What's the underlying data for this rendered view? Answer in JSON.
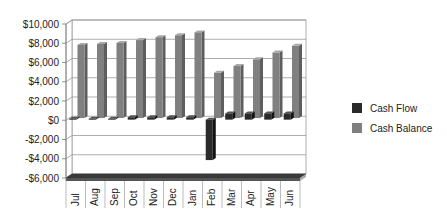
{
  "chart_data": {
    "type": "bar",
    "style": "3d-clustered-column",
    "title": "",
    "xlabel": "",
    "ylabel": "",
    "categories": [
      "Jul",
      "Aug",
      "Sep",
      "Oct",
      "Nov",
      "Dec",
      "Jan",
      "Feb",
      "Mar",
      "Apr",
      "May",
      "Jun"
    ],
    "series": [
      {
        "name": "Cash Flow",
        "color": "#2a2a2a",
        "values": [
          100,
          100,
          100,
          250,
          250,
          250,
          250,
          -4200,
          650,
          650,
          650,
          650
        ]
      },
      {
        "name": "Cash Balance",
        "color": "#808080",
        "values": [
          7600,
          7700,
          7800,
          8100,
          8400,
          8600,
          8900,
          4700,
          5400,
          6100,
          6800,
          7500
        ]
      }
    ],
    "ylim": [
      -6000,
      10000
    ],
    "yticks": [
      10000,
      8000,
      6000,
      4000,
      2000,
      0,
      -2000,
      -4000,
      -6000
    ],
    "ytick_labels": [
      "$10,000",
      "$8,000",
      "$6,000",
      "$4,000",
      "$2,000",
      "$0",
      "-$2,000",
      "-$4,000",
      "-$6,000"
    ],
    "grid": true,
    "legend_position": "right"
  },
  "legend": {
    "items": [
      {
        "label": "Cash Flow",
        "color": "#2a2a2a"
      },
      {
        "label": "Cash Balance",
        "color": "#808080"
      }
    ]
  }
}
